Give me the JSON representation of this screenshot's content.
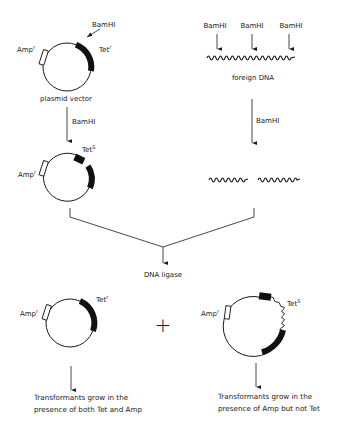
{
  "diagram": {
    "colors": {
      "ink": "#1a1a1a",
      "background": "#ffffff"
    },
    "plasmid_vector": {
      "amp_label": "Amp",
      "amp_sup": "r",
      "tet_label": "Tet",
      "tet_sup": "r",
      "site_label": "BamHI",
      "caption": "plasmid vector"
    },
    "left_step": {
      "enzyme": "BamHI"
    },
    "cut_plasmid": {
      "amp_label": "Amp",
      "amp_sup": "r",
      "tet_label": "Tet",
      "tet_sup": "S"
    },
    "foreign_dna": {
      "sites": [
        "BamHI",
        "BamHI",
        "BamHI"
      ],
      "caption": "foreign DNA"
    },
    "right_step": {
      "enzyme": "BamHI"
    },
    "join_step": {
      "enzyme": "DNA ligase"
    },
    "plus_sign": "+",
    "result_left": {
      "amp_label": "Amp",
      "amp_sup": "r",
      "tet_label": "Tet",
      "tet_sup": "r",
      "caption_line1": "Transformants grow in the",
      "caption_line2": "presence of both Tet and Amp"
    },
    "result_right": {
      "amp_label": "Amp",
      "amp_sup": "r",
      "tet_label": "Tet",
      "tet_sup": "S",
      "caption_line1": "Transformants grow in the",
      "caption_line2": "presence of Amp but not Tet"
    }
  }
}
